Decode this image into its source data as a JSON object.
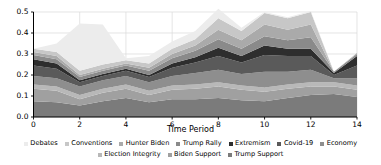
{
  "chart_data": {
    "type": "area",
    "stacked": true,
    "title": "",
    "xlabel": "Time Period",
    "ylabel": "",
    "xlim": [
      0,
      14
    ],
    "ylim": [
      0.0,
      0.5
    ],
    "grid": true,
    "legend_position": "bottom",
    "x": [
      0,
      1,
      2,
      3,
      4,
      5,
      6,
      7,
      8,
      9,
      10,
      11,
      12,
      13,
      14
    ],
    "xticks": [
      "0",
      "2",
      "4",
      "6",
      "8",
      "10",
      "12",
      "14"
    ],
    "xtick_values": [
      0,
      2,
      4,
      6,
      8,
      10,
      12,
      14
    ],
    "yticks": [
      "0.0",
      "0.1",
      "0.2",
      "0.3",
      "0.4",
      "0.5"
    ],
    "ytick_values": [
      0.0,
      0.1,
      0.2,
      0.3,
      0.4,
      0.5
    ],
    "stack_order_bottom_to_top": [
      "Trump Support",
      "Biden Support",
      "Election Integrity",
      "Economy",
      "Covid-19",
      "Extremism",
      "Trump Rally",
      "Hunter Biden",
      "Conventions",
      "Debates"
    ],
    "series": [
      {
        "name": "Trump Support",
        "color": "#7b7b7b",
        "values": [
          0.075,
          0.07,
          0.055,
          0.075,
          0.09,
          0.07,
          0.085,
          0.085,
          0.09,
          0.08,
          0.075,
          0.09,
          0.105,
          0.11,
          0.095
        ]
      },
      {
        "name": "Biden Support",
        "color": "#a0a0a0",
        "values": [
          0.06,
          0.055,
          0.03,
          0.04,
          0.045,
          0.035,
          0.045,
          0.05,
          0.055,
          0.05,
          0.045,
          0.045,
          0.04,
          0.035,
          0.035
        ]
      },
      {
        "name": "Election Integrity",
        "color": "#b8b8b8",
        "values": [
          0.02,
          0.02,
          0.02,
          0.02,
          0.02,
          0.02,
          0.02,
          0.02,
          0.02,
          0.02,
          0.02,
          0.02,
          0.02,
          0.02,
          0.02
        ]
      },
      {
        "name": "Economy",
        "color": "#8e8e8e",
        "values": [
          0.04,
          0.04,
          0.04,
          0.04,
          0.04,
          0.04,
          0.045,
          0.055,
          0.06,
          0.055,
          0.075,
          0.06,
          0.06,
          0.02,
          0.035
        ]
      },
      {
        "name": "Covid-19",
        "color": "#5a5a5a",
        "values": [
          0.05,
          0.045,
          0.02,
          0.02,
          0.025,
          0.025,
          0.04,
          0.05,
          0.065,
          0.055,
          0.08,
          0.075,
          0.065,
          0.015,
          0.06
        ]
      },
      {
        "name": "Extremism",
        "color": "#2e2e2e",
        "values": [
          0.03,
          0.025,
          0.01,
          0.01,
          0.01,
          0.01,
          0.02,
          0.025,
          0.04,
          0.03,
          0.045,
          0.035,
          0.035,
          0.01,
          0.045
        ]
      },
      {
        "name": "Trump Rally",
        "color": "#8a8a8a",
        "values": [
          0.02,
          0.02,
          0.015,
          0.015,
          0.015,
          0.02,
          0.025,
          0.03,
          0.04,
          0.035,
          0.045,
          0.04,
          0.055,
          0.005,
          0.01
        ]
      },
      {
        "name": "Hunter Biden",
        "color": "#aaaaaa",
        "values": [
          0.015,
          0.015,
          0.01,
          0.01,
          0.01,
          0.015,
          0.02,
          0.025,
          0.045,
          0.04,
          0.055,
          0.05,
          0.06,
          0.0,
          0.005
        ]
      },
      {
        "name": "Conventions",
        "color": "#c7c7c7",
        "values": [
          0.015,
          0.02,
          0.02,
          0.02,
          0.015,
          0.02,
          0.025,
          0.03,
          0.055,
          0.045,
          0.055,
          0.055,
          0.06,
          0.0,
          0.0
        ]
      },
      {
        "name": "Debates",
        "color": "#ececec",
        "values": [
          0.0,
          0.04,
          0.225,
          0.19,
          0.01,
          0.035,
          0.035,
          0.04,
          0.045,
          0.015,
          0.005,
          0.005,
          0.005,
          0.0,
          0.0
        ]
      }
    ],
    "totals": [
      0.325,
      0.35,
      0.445,
      0.44,
      0.28,
      0.29,
      0.36,
      0.41,
      0.515,
      0.425,
      0.5,
      0.475,
      0.505,
      0.215,
      0.305
    ],
    "axis": {
      "color": "#000000",
      "grid_color": "#d9d9d9"
    }
  },
  "legend": {
    "row1": [
      {
        "label": "Debates",
        "color": "#ececec"
      },
      {
        "label": "Conventions",
        "color": "#c7c7c7"
      },
      {
        "label": "Hunter Biden",
        "color": "#aaaaaa"
      },
      {
        "label": "Trump Rally",
        "color": "#8a8a8a"
      },
      {
        "label": "Extremism",
        "color": "#2e2e2e"
      },
      {
        "label": "Covid-19",
        "color": "#5a5a5a"
      },
      {
        "label": "Economy",
        "color": "#8e8e8e"
      }
    ],
    "row2": [
      {
        "label": "Election Integrity",
        "color": "#b8b8b8"
      },
      {
        "label": "Biden Support",
        "color": "#a0a0a0"
      },
      {
        "label": "Trump Support",
        "color": "#7b7b7b"
      }
    ]
  }
}
